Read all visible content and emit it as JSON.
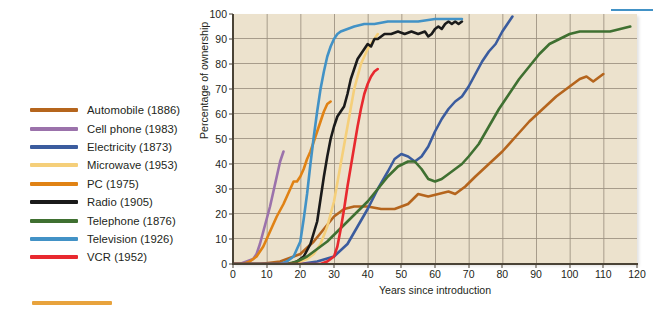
{
  "chart_data": {
    "type": "line",
    "title": "",
    "xlabel": "Years since introduction",
    "ylabel": "Percentage of ownership",
    "xlim": [
      0,
      120
    ],
    "ylim": [
      0,
      100
    ],
    "xticks": [
      0,
      10,
      20,
      30,
      40,
      50,
      60,
      70,
      80,
      90,
      100,
      110,
      120
    ],
    "yticks": [
      0,
      10,
      20,
      30,
      40,
      50,
      60,
      70,
      80,
      90,
      100
    ],
    "grid": true,
    "legend_position": "left-outside",
    "plot_background": "#ece2cd",
    "grid_color": "#9b9080",
    "axis_color": "#4a4336",
    "series": [
      {
        "name": "Automobile (1886)",
        "label": "Automobile (1886)",
        "year": 1886,
        "color": "#b5651d",
        "points": [
          [
            0,
            0
          ],
          [
            8,
            0
          ],
          [
            14,
            1
          ],
          [
            20,
            4
          ],
          [
            24,
            9
          ],
          [
            27,
            14
          ],
          [
            30,
            19
          ],
          [
            33,
            22
          ],
          [
            36,
            23
          ],
          [
            40,
            23
          ],
          [
            44,
            22
          ],
          [
            48,
            22
          ],
          [
            52,
            24
          ],
          [
            55,
            28
          ],
          [
            58,
            27
          ],
          [
            61,
            28
          ],
          [
            64,
            29
          ],
          [
            66,
            28
          ],
          [
            69,
            31
          ],
          [
            72,
            35
          ],
          [
            76,
            40
          ],
          [
            80,
            45
          ],
          [
            84,
            51
          ],
          [
            88,
            57
          ],
          [
            92,
            62
          ],
          [
            96,
            67
          ],
          [
            100,
            71
          ],
          [
            103,
            74
          ],
          [
            105,
            75
          ],
          [
            107,
            73
          ],
          [
            109,
            75
          ],
          [
            110,
            76
          ]
        ]
      },
      {
        "name": "Cell phone (1983)",
        "label": "Cell phone (1983)",
        "year": 1983,
        "color": "#9b72ab",
        "points": [
          [
            0,
            0
          ],
          [
            2,
            0
          ],
          [
            4,
            1
          ],
          [
            6,
            2
          ],
          [
            7,
            4
          ],
          [
            8,
            8
          ],
          [
            9,
            13
          ],
          [
            10,
            18
          ],
          [
            11,
            23
          ],
          [
            12,
            29
          ],
          [
            13,
            35
          ],
          [
            14,
            41
          ],
          [
            15,
            45
          ]
        ]
      },
      {
        "name": "Electricity (1873)",
        "label": "Electricity (1873)",
        "year": 1873,
        "color": "#3b5c9e",
        "points": [
          [
            0,
            0
          ],
          [
            20,
            0
          ],
          [
            25,
            1
          ],
          [
            30,
            3
          ],
          [
            34,
            8
          ],
          [
            37,
            15
          ],
          [
            40,
            22
          ],
          [
            43,
            30
          ],
          [
            46,
            37
          ],
          [
            48,
            42
          ],
          [
            50,
            44
          ],
          [
            52,
            43
          ],
          [
            54,
            41
          ],
          [
            56,
            43
          ],
          [
            58,
            47
          ],
          [
            60,
            53
          ],
          [
            62,
            58
          ],
          [
            64,
            62
          ],
          [
            66,
            65
          ],
          [
            68,
            67
          ],
          [
            70,
            71
          ],
          [
            72,
            76
          ],
          [
            74,
            81
          ],
          [
            76,
            85
          ],
          [
            78,
            88
          ],
          [
            80,
            93
          ],
          [
            82,
            97
          ],
          [
            83,
            99
          ]
        ]
      },
      {
        "name": "Microwave (1953)",
        "label": "Microwave (1953)",
        "year": 1953,
        "color": "#f5cf7a",
        "points": [
          [
            0,
            0
          ],
          [
            18,
            0
          ],
          [
            20,
            1
          ],
          [
            22,
            2
          ],
          [
            24,
            4
          ],
          [
            26,
            8
          ],
          [
            28,
            15
          ],
          [
            30,
            25
          ],
          [
            32,
            40
          ],
          [
            34,
            55
          ],
          [
            36,
            70
          ],
          [
            38,
            80
          ],
          [
            40,
            86
          ],
          [
            42,
            90
          ],
          [
            43,
            92
          ]
        ]
      },
      {
        "name": "PC (1975)",
        "label": "PC (1975)",
        "year": 1975,
        "color": "#e08214",
        "points": [
          [
            0,
            0
          ],
          [
            3,
            0
          ],
          [
            5,
            1
          ],
          [
            7,
            3
          ],
          [
            9,
            7
          ],
          [
            11,
            13
          ],
          [
            13,
            19
          ],
          [
            15,
            24
          ],
          [
            17,
            30
          ],
          [
            18,
            33
          ],
          [
            19,
            33
          ],
          [
            20,
            35
          ],
          [
            21,
            38
          ],
          [
            22,
            42
          ],
          [
            23,
            45
          ],
          [
            24,
            49
          ],
          [
            25,
            53
          ],
          [
            26,
            57
          ],
          [
            27,
            61
          ],
          [
            28,
            64
          ],
          [
            29,
            65
          ]
        ]
      },
      {
        "name": "Radio (1905)",
        "label": "Radio (1905)",
        "year": 1905,
        "color": "#1a1a1a",
        "points": [
          [
            0,
            0
          ],
          [
            17,
            0
          ],
          [
            19,
            1
          ],
          [
            21,
            3
          ],
          [
            23,
            8
          ],
          [
            25,
            17
          ],
          [
            26,
            26
          ],
          [
            27,
            35
          ],
          [
            28,
            43
          ],
          [
            29,
            50
          ],
          [
            30,
            55
          ],
          [
            31,
            59
          ],
          [
            32,
            61
          ],
          [
            33,
            63
          ],
          [
            34,
            68
          ],
          [
            35,
            74
          ],
          [
            36,
            78
          ],
          [
            37,
            82
          ],
          [
            38,
            84
          ],
          [
            39,
            86
          ],
          [
            40,
            88
          ],
          [
            41,
            87
          ],
          [
            42,
            90
          ],
          [
            43,
            90
          ],
          [
            45,
            92
          ],
          [
            47,
            92
          ],
          [
            49,
            93
          ],
          [
            51,
            92
          ],
          [
            53,
            93
          ],
          [
            55,
            92
          ],
          [
            57,
            93
          ],
          [
            58,
            91
          ],
          [
            59,
            92
          ],
          [
            60,
            94
          ],
          [
            61,
            95
          ],
          [
            62,
            94
          ],
          [
            63,
            96
          ],
          [
            64,
            97
          ],
          [
            65,
            96
          ],
          [
            66,
            97
          ],
          [
            67,
            96
          ],
          [
            68,
            97
          ]
        ]
      },
      {
        "name": "Telephone (1876)",
        "label": "Telephone (1876)",
        "year": 1876,
        "color": "#3f7031",
        "points": [
          [
            0,
            0
          ],
          [
            16,
            0
          ],
          [
            19,
            1
          ],
          [
            22,
            3
          ],
          [
            25,
            6
          ],
          [
            28,
            9
          ],
          [
            31,
            13
          ],
          [
            34,
            17
          ],
          [
            37,
            21
          ],
          [
            40,
            25
          ],
          [
            43,
            30
          ],
          [
            46,
            35
          ],
          [
            49,
            39
          ],
          [
            52,
            41
          ],
          [
            54,
            41
          ],
          [
            56,
            38
          ],
          [
            58,
            34
          ],
          [
            60,
            33
          ],
          [
            62,
            34
          ],
          [
            64,
            36
          ],
          [
            66,
            38
          ],
          [
            68,
            40
          ],
          [
            70,
            43
          ],
          [
            73,
            48
          ],
          [
            76,
            55
          ],
          [
            79,
            62
          ],
          [
            82,
            68
          ],
          [
            85,
            74
          ],
          [
            88,
            79
          ],
          [
            91,
            84
          ],
          [
            94,
            88
          ],
          [
            97,
            90
          ],
          [
            100,
            92
          ],
          [
            103,
            93
          ],
          [
            106,
            93
          ],
          [
            109,
            93
          ],
          [
            112,
            93
          ],
          [
            115,
            94
          ],
          [
            118,
            95
          ]
        ]
      },
      {
        "name": "Television (1926)",
        "label": "Television (1926)",
        "year": 1926,
        "color": "#4292c6",
        "points": [
          [
            0,
            0
          ],
          [
            14,
            0
          ],
          [
            16,
            1
          ],
          [
            18,
            3
          ],
          [
            20,
            9
          ],
          [
            21,
            18
          ],
          [
            22,
            28
          ],
          [
            23,
            40
          ],
          [
            24,
            51
          ],
          [
            25,
            61
          ],
          [
            26,
            70
          ],
          [
            27,
            77
          ],
          [
            28,
            83
          ],
          [
            29,
            87
          ],
          [
            30,
            90
          ],
          [
            31,
            92
          ],
          [
            32,
            93
          ],
          [
            34,
            94
          ],
          [
            36,
            95
          ],
          [
            39,
            96
          ],
          [
            42,
            96
          ],
          [
            46,
            97
          ],
          [
            50,
            97
          ],
          [
            55,
            97
          ],
          [
            60,
            98
          ],
          [
            64,
            98
          ],
          [
            68,
            98
          ]
        ]
      },
      {
        "name": "VCR (1952)",
        "label": "VCR (1952)",
        "year": 1952,
        "color": "#e8292f",
        "points": [
          [
            0,
            0
          ],
          [
            26,
            0
          ],
          [
            28,
            1
          ],
          [
            30,
            3
          ],
          [
            31,
            7
          ],
          [
            32,
            14
          ],
          [
            33,
            22
          ],
          [
            34,
            31
          ],
          [
            35,
            39
          ],
          [
            36,
            47
          ],
          [
            37,
            55
          ],
          [
            38,
            62
          ],
          [
            39,
            68
          ],
          [
            40,
            72
          ],
          [
            41,
            75
          ],
          [
            42,
            77
          ],
          [
            43,
            78
          ]
        ]
      }
    ]
  },
  "legend": {
    "items": [
      {
        "label": "Automobile (1886)",
        "color": "#b5651d"
      },
      {
        "label": "Cell phone (1983)",
        "color": "#9b72ab"
      },
      {
        "label": "Electricity (1873)",
        "color": "#3b5c9e"
      },
      {
        "label": "Microwave (1953)",
        "color": "#f5cf7a"
      },
      {
        "label": "PC (1975)",
        "color": "#e08214"
      },
      {
        "label": "Radio (1905)",
        "color": "#1a1a1a"
      },
      {
        "label": "Telephone (1876)",
        "color": "#3f7031"
      },
      {
        "label": "Television (1926)",
        "color": "#4292c6"
      },
      {
        "label": "VCR (1952)",
        "color": "#e8292f"
      }
    ]
  }
}
